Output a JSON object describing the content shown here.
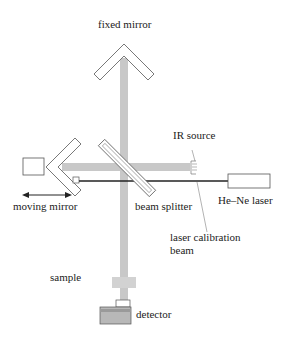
{
  "diagram": {
    "labels": {
      "fixed_mirror": "fixed mirror",
      "ir_source": "IR source",
      "moving_mirror": "moving mirror",
      "beam_splitter": "beam splitter",
      "he_ne_laser": "He–Ne laser",
      "laser_calibration_1": "laser calibration",
      "laser_calibration_2": "beam",
      "sample": "sample",
      "detector": "detector"
    },
    "colors": {
      "ir_beam": "#c8c8c8",
      "laser_beam": "#222222",
      "outline": "#555555",
      "detector_fill": "#b8b8b8",
      "detector_band": "#9a9a9a"
    }
  }
}
